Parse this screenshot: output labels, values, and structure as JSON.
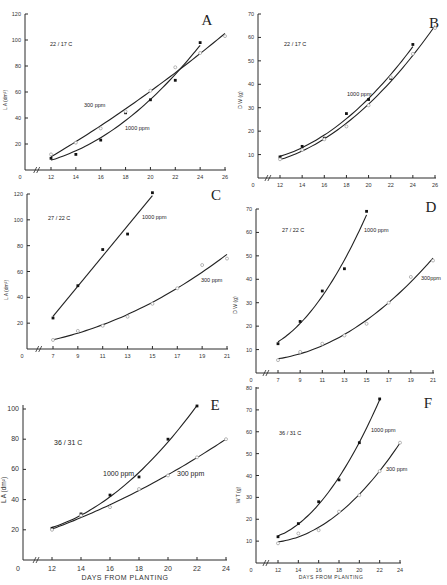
{
  "chart_data": [
    {
      "id": "A",
      "type": "line",
      "panel_letter": "A",
      "annotation": "22 / 17 C",
      "ylabel": "L A (dm²)",
      "xlabel": "",
      "xlim": [
        0,
        26
      ],
      "ylim": [
        0,
        120
      ],
      "xticks": [
        12,
        14,
        16,
        18,
        20,
        22,
        24,
        26
      ],
      "yticks": [
        20,
        40,
        60,
        80,
        100,
        120
      ],
      "axis_break": true,
      "series": [
        {
          "name": "1000 ppm",
          "marker": "filled",
          "x": [
            12,
            14,
            16,
            18,
            20,
            22,
            24
          ],
          "y": [
            9,
            12,
            23,
            44,
            54,
            69,
            98
          ]
        },
        {
          "name": "300 ppm",
          "marker": "open",
          "x": [
            12,
            14,
            16,
            18,
            20,
            22,
            24,
            26
          ],
          "y": [
            12,
            21,
            32,
            45,
            61,
            79,
            90,
            103
          ]
        }
      ]
    },
    {
      "id": "B",
      "type": "line",
      "panel_letter": "B",
      "annotation": "22 / 17 C",
      "ylabel": "D W (g)",
      "xlabel": "",
      "xlim": [
        0,
        26
      ],
      "ylim": [
        0,
        70
      ],
      "xticks": [
        12,
        14,
        16,
        18,
        20,
        22,
        24,
        26
      ],
      "yticks": [
        10,
        20,
        30,
        40,
        50,
        60,
        70
      ],
      "axis_break": true,
      "series": [
        {
          "name": "1000 ppm",
          "marker": "filled",
          "x": [
            12,
            14,
            16,
            18,
            20,
            22,
            24
          ],
          "y": [
            9,
            13.5,
            17,
            27.5,
            33.5,
            42.5,
            57
          ]
        },
        {
          "name": "300 ppm",
          "marker": "open",
          "x": [
            12,
            14,
            16,
            18,
            20,
            22,
            24,
            26
          ],
          "y": [
            8,
            12,
            16.5,
            22,
            31,
            43,
            53,
            64
          ]
        }
      ]
    },
    {
      "id": "C",
      "type": "line",
      "panel_letter": "C",
      "annotation": "27 / 22 C",
      "ylabel": "L A (dm²)",
      "xlabel": "",
      "xlim": [
        0,
        21
      ],
      "ylim": [
        0,
        120
      ],
      "xticks": [
        7,
        9,
        11,
        13,
        15,
        17,
        19,
        21
      ],
      "yticks": [
        20,
        40,
        60,
        80,
        100,
        120
      ],
      "axis_break": true,
      "series": [
        {
          "name": "1000 ppm",
          "marker": "filled",
          "x": [
            7,
            9,
            11,
            13,
            15
          ],
          "y": [
            24,
            49,
            77,
            89,
            121
          ]
        },
        {
          "name": "300 ppm",
          "marker": "open",
          "x": [
            7,
            9,
            11,
            13,
            15,
            17,
            19,
            21
          ],
          "y": [
            7,
            14,
            18,
            25,
            35,
            47,
            65,
            70
          ]
        }
      ]
    },
    {
      "id": "D",
      "type": "line",
      "panel_letter": "D",
      "annotation": "27 / 22 C",
      "ylabel": "D W (g)",
      "xlabel": "",
      "xlim": [
        0,
        21
      ],
      "ylim": [
        0,
        70
      ],
      "xticks": [
        7,
        9,
        11,
        13,
        15,
        17,
        19,
        21
      ],
      "yticks": [
        10,
        20,
        30,
        40,
        50,
        60,
        70
      ],
      "axis_break": true,
      "series": [
        {
          "name": "1000 ppm",
          "marker": "filled",
          "x": [
            7,
            9,
            11,
            13,
            15
          ],
          "y": [
            12.5,
            22,
            35,
            44.5,
            69
          ]
        },
        {
          "name": "300ppm",
          "marker": "open",
          "x": [
            7,
            9,
            11,
            13,
            15,
            17,
            19,
            21
          ],
          "y": [
            5.5,
            9,
            12.5,
            16,
            21,
            30,
            41,
            48
          ]
        }
      ]
    },
    {
      "id": "E",
      "type": "line",
      "panel_letter": "E",
      "annotation": "36 / 31 C",
      "ylabel": "L A (dm²)",
      "xlabel": "DAYS   FROM   PLANTING",
      "xlim": [
        0,
        24
      ],
      "ylim": [
        0,
        100
      ],
      "xticks": [
        12,
        14,
        16,
        18,
        20,
        22,
        24
      ],
      "yticks": [
        20,
        40,
        60,
        80,
        100
      ],
      "axis_break": true,
      "series": [
        {
          "name": "1000 ppm",
          "marker": "filled",
          "x": [
            12,
            14,
            16,
            18,
            20,
            22
          ],
          "y": [
            21,
            30.5,
            43,
            55,
            80,
            102
          ]
        },
        {
          "name": "300 ppm",
          "marker": "open",
          "x": [
            12,
            14,
            16,
            18,
            20,
            22,
            24
          ],
          "y": [
            20,
            29.5,
            35,
            47,
            56,
            68,
            80
          ]
        }
      ]
    },
    {
      "id": "F",
      "type": "line",
      "panel_letter": "F",
      "annotation": "36 / 31 C",
      "ylabel": "W T (g)",
      "xlabel": "DAYS   FROM   PLANTING",
      "xlim": [
        0,
        24
      ],
      "ylim": [
        0,
        80
      ],
      "xticks": [
        12,
        14,
        16,
        18,
        20,
        22,
        24
      ],
      "yticks": [
        10,
        20,
        30,
        40,
        50,
        60,
        70,
        80
      ],
      "axis_break": true,
      "series": [
        {
          "name": "1000 ppm",
          "marker": "filled",
          "x": [
            12,
            14,
            16,
            18,
            20,
            22
          ],
          "y": [
            12,
            18,
            28,
            38,
            55,
            75
          ]
        },
        {
          "name": "300 ppm",
          "marker": "open",
          "x": [
            12,
            14,
            16,
            18,
            20,
            22,
            24
          ],
          "y": [
            9,
            13.5,
            15,
            23.5,
            31,
            42,
            55
          ]
        }
      ]
    }
  ]
}
